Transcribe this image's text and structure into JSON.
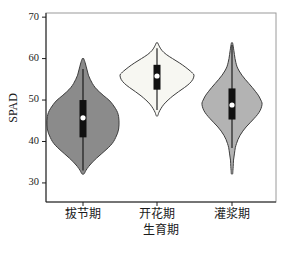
{
  "chart_data": {
    "type": "violin",
    "title": "",
    "xlabel": "生育期",
    "ylabel": "SPAD",
    "categories": [
      "拔节期",
      "开花期",
      "灌浆期"
    ],
    "yticks": [
      30,
      40,
      50,
      60,
      70
    ],
    "ylim": [
      25.4,
      71
    ],
    "grid": false,
    "legend": "none",
    "violins": [
      {
        "label": "拔节期",
        "fill": "#8b8b8b",
        "min": 32,
        "max": 60,
        "whisker_low": 33,
        "whisker_high": 57.5,
        "q1": 41,
        "q3": 50,
        "median": 45.7,
        "profile": [
          [
            60,
            0.02
          ],
          [
            59,
            0.06
          ],
          [
            58,
            0.09
          ],
          [
            57,
            0.12
          ],
          [
            56,
            0.15
          ],
          [
            55,
            0.2
          ],
          [
            54,
            0.26
          ],
          [
            53,
            0.34
          ],
          [
            52,
            0.45
          ],
          [
            51,
            0.58
          ],
          [
            50,
            0.72
          ],
          [
            49,
            0.82
          ],
          [
            48,
            0.9
          ],
          [
            47,
            0.96
          ],
          [
            46,
            0.99
          ],
          [
            45,
            1.0
          ],
          [
            44,
            1.0
          ],
          [
            43,
            0.99
          ],
          [
            42,
            0.96
          ],
          [
            41,
            0.91
          ],
          [
            40,
            0.85
          ],
          [
            39,
            0.76
          ],
          [
            38,
            0.64
          ],
          [
            37,
            0.51
          ],
          [
            36,
            0.38
          ],
          [
            35,
            0.26
          ],
          [
            34,
            0.16
          ],
          [
            33,
            0.08
          ],
          [
            32.2,
            0.03
          ]
        ]
      },
      {
        "label": "开花期",
        "fill": "#f7f7f2",
        "min": 46,
        "max": 64,
        "whisker_low": 47.6,
        "whisker_high": 62.5,
        "q1": 52.5,
        "q3": 58.5,
        "median": 55.8,
        "profile": [
          [
            63.8,
            0.02
          ],
          [
            63,
            0.06
          ],
          [
            62,
            0.13
          ],
          [
            61,
            0.25
          ],
          [
            60,
            0.42
          ],
          [
            59,
            0.6
          ],
          [
            58,
            0.76
          ],
          [
            57,
            0.9
          ],
          [
            56.5,
            0.96
          ],
          [
            56,
            1.0
          ],
          [
            55,
            0.97
          ],
          [
            54,
            0.88
          ],
          [
            53,
            0.74
          ],
          [
            52,
            0.58
          ],
          [
            51,
            0.43
          ],
          [
            50,
            0.3
          ],
          [
            49,
            0.19
          ],
          [
            48,
            0.11
          ],
          [
            47,
            0.05
          ],
          [
            46.2,
            0.02
          ]
        ]
      },
      {
        "label": "灌浆期",
        "fill": "#b3b3b3",
        "min": 32,
        "max": 64,
        "whisker_low": 38.4,
        "whisker_high": 63.3,
        "q1": 45.3,
        "q3": 52.8,
        "median": 48.8,
        "profile": [
          [
            63.8,
            0.02
          ],
          [
            63,
            0.04
          ],
          [
            62,
            0.06
          ],
          [
            61,
            0.08
          ],
          [
            60,
            0.1
          ],
          [
            59,
            0.13
          ],
          [
            58,
            0.17
          ],
          [
            57,
            0.24
          ],
          [
            56,
            0.33
          ],
          [
            55,
            0.44
          ],
          [
            54,
            0.56
          ],
          [
            53,
            0.68
          ],
          [
            52,
            0.79
          ],
          [
            51,
            0.89
          ],
          [
            50,
            0.96
          ],
          [
            49.3,
            1.0
          ],
          [
            48.5,
            0.99
          ],
          [
            47.5,
            0.94
          ],
          [
            46.5,
            0.85
          ],
          [
            45.5,
            0.73
          ],
          [
            44.5,
            0.6
          ],
          [
            43.5,
            0.47
          ],
          [
            42.5,
            0.36
          ],
          [
            41.5,
            0.27
          ],
          [
            40.5,
            0.2
          ],
          [
            39.5,
            0.15
          ],
          [
            38.5,
            0.11
          ],
          [
            37,
            0.08
          ],
          [
            35.5,
            0.05
          ],
          [
            34,
            0.04
          ],
          [
            33,
            0.03
          ],
          [
            32.2,
            0.02
          ]
        ]
      }
    ],
    "colors": {
      "violin_stroke": "#3c3c3c",
      "box": "#111111",
      "whisker": "#111111",
      "median_dot": "#ffffff",
      "frame": "#9a9a9a",
      "axis": "#1c1c1c",
      "background": "#ffffff"
    },
    "layout": {
      "width": 282,
      "height": 254,
      "plot": {
        "left": 46,
        "right": 276,
        "top": 13,
        "bottom": 202
      },
      "x_centers": [
        83,
        157,
        232
      ],
      "max_halfwidths": [
        36,
        37,
        30
      ],
      "box_width": 7,
      "median_dot_radius": 2.6,
      "tick_len": 4,
      "ytick_label_x": 41,
      "xtick_label_y": 215,
      "xlabel_y": 231,
      "ylabel_x": 14,
      "ylabel_y": 108
    }
  }
}
